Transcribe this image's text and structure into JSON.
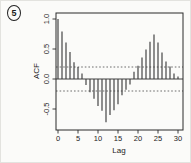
{
  "figure": {
    "marker_label": "5"
  },
  "chart_data": {
    "type": "bar",
    "subtype": "acf-stem-plot",
    "title": "",
    "xlabel": "Lag",
    "ylabel": "ACF",
    "x": [
      0,
      1,
      2,
      3,
      4,
      5,
      6,
      7,
      8,
      9,
      10,
      11,
      12,
      13,
      14,
      15,
      16,
      17,
      18,
      19,
      20,
      21,
      22,
      23,
      24,
      25,
      26,
      27,
      28,
      29,
      30
    ],
    "values": [
      1.0,
      0.79,
      0.61,
      0.45,
      0.28,
      0.2,
      0.09,
      -0.1,
      -0.22,
      -0.33,
      -0.45,
      -0.53,
      -0.72,
      -0.6,
      -0.52,
      -0.42,
      -0.27,
      -0.18,
      -0.09,
      0.12,
      0.22,
      0.36,
      0.49,
      0.62,
      0.74,
      0.61,
      0.44,
      0.29,
      0.21,
      0.09,
      0.04
    ],
    "xlim": [
      -0.5,
      31.25
    ],
    "ylim": [
      -0.85,
      1.1
    ],
    "x_ticks": [
      0,
      5,
      10,
      15,
      20,
      25,
      30
    ],
    "x_tick_labels": [
      "0",
      "5",
      "10",
      "15",
      "20",
      "25",
      "30"
    ],
    "y_ticks": [
      -0.5,
      0.0,
      0.5,
      1.0
    ],
    "y_tick_labels": [
      "-0.5",
      "0.0",
      "0.5",
      "1.0"
    ],
    "zero_line": true,
    "conf_level": 0.2,
    "conf_line_style": "dashed",
    "grid": false,
    "legend": "none",
    "colors": {
      "ink": "#2b2b2b",
      "bar": "#3d3d3d",
      "conf_line": "#4a4a4a",
      "paper": "#fbfbf9"
    }
  }
}
